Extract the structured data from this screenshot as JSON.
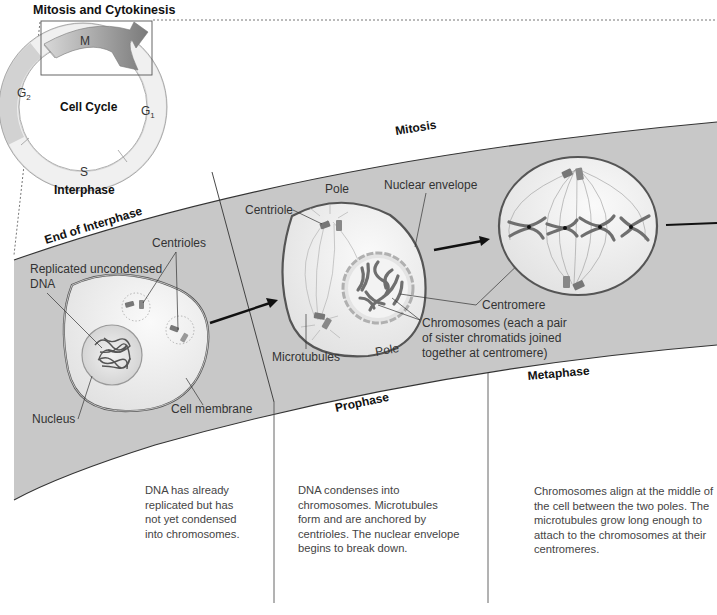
{
  "title": "Mitosis and Cytokinesis",
  "cell_cycle": {
    "center_label": "Cell Cycle",
    "phases": [
      {
        "id": "M",
        "label": "M"
      },
      {
        "id": "G1",
        "label": "G",
        "sub": "1"
      },
      {
        "id": "S",
        "label": "S"
      },
      {
        "id": "G2",
        "label": "G",
        "sub": "2"
      }
    ],
    "interphase_label": "Interphase"
  },
  "band": {
    "mitosis_label": "Mitosis",
    "stages": [
      {
        "name": "End of Interphase",
        "description": "DNA has already\nreplicated but has\nnot yet condensed\ninto chromosomes.",
        "labels": {
          "replicated_dna": "Replicated uncondensed\nDNA",
          "centrioles": "Centrioles",
          "nucleus": "Nucleus",
          "cell_membrane": "Cell membrane"
        }
      },
      {
        "name": "Prophase",
        "description": "DNA condenses into\nchromosomes. Microtubules\nform and are anchored by\ncentrioles. The nuclear envelope\nbegins to break down.",
        "labels": {
          "pole_top": "Pole",
          "centriole": "Centriole",
          "nuclear_envelope": "Nuclear envelope",
          "microtubules": "Microtubules",
          "pole_bottom": "Pole",
          "centromere": "Centromere",
          "chromosomes": "Chromosomes (each a pair\nof sister chromatids joined\ntogether at centromere)"
        }
      },
      {
        "name": "Metaphase",
        "description": "Chromosomes align at the middle of\nthe cell between the two poles. The\nmicrotubules grow long enough to\nattach to the chromosomes at their\ncentromeres."
      }
    ]
  },
  "colors": {
    "band_fill": "#c9c9c9",
    "cell_fill": "#eeeeee",
    "m_arrow": "#8a8a8a",
    "ring_g2": "#cfcfcf",
    "ring_light": "#ececec",
    "chromosome": "#6f6f6f"
  }
}
